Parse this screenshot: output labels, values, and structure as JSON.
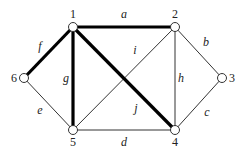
{
  "diagram": {
    "type": "graph",
    "nodes": [
      {
        "id": "1",
        "label": "1",
        "x": 73,
        "y": 27,
        "lx": 73,
        "ly": 18,
        "anchor": "middle"
      },
      {
        "id": "2",
        "label": "2",
        "x": 175,
        "y": 27,
        "lx": 175,
        "ly": 18,
        "anchor": "middle"
      },
      {
        "id": "3",
        "label": "3",
        "x": 222,
        "y": 78,
        "lx": 229,
        "ly": 82,
        "anchor": "start"
      },
      {
        "id": "4",
        "label": "4",
        "x": 175,
        "y": 130,
        "lx": 175,
        "ly": 146,
        "anchor": "middle"
      },
      {
        "id": "5",
        "label": "5",
        "x": 73,
        "y": 130,
        "lx": 73,
        "ly": 146,
        "anchor": "middle"
      },
      {
        "id": "6",
        "label": "6",
        "x": 24,
        "y": 78,
        "lx": 17,
        "ly": 82,
        "anchor": "end"
      }
    ],
    "edges": [
      {
        "id": "a",
        "label": "a",
        "from": "1",
        "to": "2",
        "bold": true,
        "lx": 124,
        "ly": 18
      },
      {
        "id": "b",
        "label": "b",
        "from": "2",
        "to": "3",
        "bold": false,
        "lx": 206,
        "ly": 46
      },
      {
        "id": "c",
        "label": "c",
        "from": "3",
        "to": "4",
        "bold": false,
        "lx": 207,
        "ly": 116
      },
      {
        "id": "d",
        "label": "d",
        "from": "5",
        "to": "4",
        "bold": false,
        "lx": 124,
        "ly": 146
      },
      {
        "id": "e",
        "label": "e",
        "from": "6",
        "to": "5",
        "bold": false,
        "lx": 40,
        "ly": 114
      },
      {
        "id": "f",
        "label": "f",
        "from": "6",
        "to": "1",
        "bold": true,
        "lx": 40,
        "ly": 50
      },
      {
        "id": "g",
        "label": "g",
        "from": "1",
        "to": "5",
        "bold": true,
        "lx": 66,
        "ly": 82
      },
      {
        "id": "h",
        "label": "h",
        "from": "2",
        "to": "4",
        "bold": false,
        "lx": 181,
        "ly": 82
      },
      {
        "id": "i",
        "label": "i",
        "from": "2",
        "to": "5",
        "bold": false,
        "lx": 135,
        "ly": 54
      },
      {
        "id": "j",
        "label": "j",
        "from": "1",
        "to": "4",
        "bold": true,
        "lx": 136,
        "ly": 112
      }
    ],
    "colors": {
      "edge_thin": "#333333",
      "edge_bold": "#000000",
      "node_fill": "#ffffff",
      "node_stroke": "#333333"
    }
  }
}
